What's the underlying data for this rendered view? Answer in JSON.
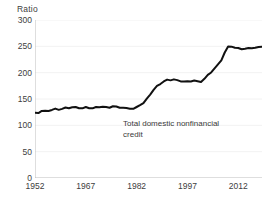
{
  "chart_data": {
    "type": "line",
    "title": "",
    "subtitle": "",
    "ylabel": "Ratio",
    "xlabel": "",
    "ylim": [
      0,
      300
    ],
    "xlim": [
      1952,
      2019
    ],
    "yticks": [
      0,
      50,
      100,
      150,
      200,
      250,
      300
    ],
    "ytick_labels": [
      "0",
      "50",
      "100",
      "150",
      "200",
      "250",
      "300"
    ],
    "xticks": [
      1952,
      1967,
      1982,
      1997,
      2012
    ],
    "xtick_labels": [
      "1952",
      "1967",
      "1982",
      "1997",
      "2012"
    ],
    "grid": "faint-horizontal",
    "legend": "none",
    "line_color": "#111111",
    "line_width": 2,
    "annotations": [
      {
        "name": "series-label",
        "line1": "Total domestic nonfinancial",
        "line2": "credit",
        "x": 1978,
        "y": 112
      }
    ],
    "series": [
      {
        "name": "Total domestic nonfinancial credit",
        "x": [
          1952,
          1953,
          1954,
          1955,
          1956,
          1957,
          1958,
          1959,
          1960,
          1961,
          1962,
          1963,
          1964,
          1965,
          1966,
          1967,
          1968,
          1969,
          1970,
          1971,
          1972,
          1973,
          1974,
          1975,
          1976,
          1977,
          1978,
          1979,
          1980,
          1981,
          1982,
          1983,
          1984,
          1985,
          1986,
          1987,
          1988,
          1989,
          1990,
          1991,
          1992,
          1993,
          1994,
          1995,
          1996,
          1997,
          1998,
          1999,
          2000,
          2001,
          2002,
          2003,
          2004,
          2005,
          2006,
          2007,
          2008,
          2009,
          2010,
          2011,
          2012,
          2013,
          2014,
          2015,
          2016,
          2017,
          2018,
          2019
        ],
        "values": [
          123,
          124,
          127,
          127,
          128,
          129,
          131,
          130,
          131,
          133,
          133,
          134,
          134,
          133,
          132,
          134,
          133,
          132,
          134,
          135,
          135,
          134,
          134,
          136,
          135,
          134,
          133,
          132,
          132,
          131,
          134,
          139,
          142,
          150,
          159,
          167,
          174,
          179,
          183,
          186,
          186,
          187,
          185,
          184,
          183,
          183,
          184,
          185,
          183,
          183,
          188,
          195,
          201,
          208,
          215,
          224,
          238,
          249,
          250,
          247,
          246,
          245,
          245,
          246,
          247,
          247,
          248,
          250
        ]
      }
    ],
    "footnote_clipped": ""
  }
}
